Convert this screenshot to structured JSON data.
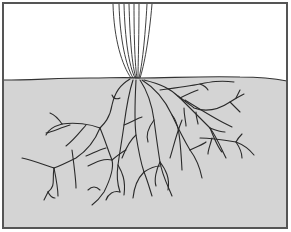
{
  "diagram": {
    "title": "",
    "colors": {
      "background": "#ffffff",
      "soil": "#d4d4d4",
      "frame": "#555555",
      "line": "#2a2a2a"
    },
    "frame": {
      "x": 3,
      "y": 3,
      "width": 284,
      "height": 225
    },
    "soil_surface": "M4,80 C30,80 60,78 90,78 C110,78 125,77 140,78 C170,78 200,76 240,77 C260,77 272,78 287,81",
    "soil_fill": "M4,80 C30,80 60,78 90,78 C110,78 125,77 140,78 C170,78 200,76 240,77 C260,77 272,78 287,81 L287,227 L4,227 Z",
    "stem_lines": [
      "M113,4 C114,40 122,65 131,78",
      "M119,4 C120,40 126,66 133,78",
      "M124,4 C125,40 129,66 135,78",
      "M129,4 C130,40 132,66 136,78",
      "M134,4 C134,40 135,66 137,78",
      "M139,4 C139,40 138,66 138,78",
      "M147,4 C145,40 142,66 139,78",
      "M152,4 C149,40 144,66 140,78"
    ],
    "roots": [
      "M130,79 C120,85 115,92 112,105 C110,118 104,124 100,128",
      "M112,95 C113,98 116,100 120,98",
      "M100,128 C90,124 75,122 62,124",
      "M62,124 C55,126 48,130 46,135",
      "M62,124 C58,118 55,115 50,113",
      "M100,128 C96,138 88,150 76,158 C68,162 60,166 54,168",
      "M54,168 C42,164 32,160 22,158",
      "M54,168 C56,178 58,190 58,196",
      "M54,168 C52,180 56,186 48,192",
      "M48,192 C50,196 52,198 55,198",
      "M48,192 C46,196 45,198 44,200",
      "M72,150 C74,165 76,180 76,188",
      "M70,125 C60,128 52,132 46,133",
      "M86,125 C80,132 74,140 66,146",
      "M100,128 C105,140 108,150 112,160 C114,168 110,180 104,192 C100,198 96,202 92,205",
      "M112,160 C104,158 96,162 88,166",
      "M112,160 C118,155 122,152 126,150",
      "M106,148 C98,150 92,154 86,156",
      "M100,190 C96,186 92,186 88,190",
      "M133,80 C128,95 126,110 124,125 C122,140 120,150 118,165 C116,178 118,186 120,192",
      "M118,165 C122,172 126,180 124,195",
      "M124,125 C132,122 138,118 142,117",
      "M120,192 C114,190 108,194 106,200",
      "M136,80 C135,100 134,118 136,135 C138,148 140,160 144,172 C148,182 150,190 152,196",
      "M136,135 C130,140 126,148 122,158",
      "M144,172 C138,178 134,188 133,198",
      "M144,172 C150,168 156,166 160,166",
      "M140,80 C148,92 152,105 154,120 C156,135 158,150 160,162 C162,175 168,186 172,196",
      "M154,120 C148,128 146,136 148,142",
      "M160,162 C166,170 170,178 168,190",
      "M160,162 C156,170 154,180 156,186",
      "M142,80 C155,88 165,100 172,115 C178,128 184,140 190,150",
      "M172,115 C178,122 180,132 182,170",
      "M182,120 C176,135 174,145 170,158",
      "M190,150 C196,158 200,168 202,178",
      "M190,150 C198,146 204,144 206,142",
      "M144,80 C160,84 170,88 180,98 C190,108 200,118 210,128 C216,136 222,150 226,158",
      "M210,128 C214,138 218,148 222,152",
      "M180,98 C186,95 192,92 198,90",
      "M160,90 C175,88 190,86 200,84 C210,82 220,80 234,82",
      "M200,84 C205,86 207,88 208,90",
      "M178,96 C186,102 192,106 194,108 C205,112 218,110 230,102 C236,98 240,96 244,94",
      "M230,102 C234,106 238,110 240,112",
      "M236,98 C238,94 239,92 240,90",
      "M185,100 C198,108 214,118 226,124 C230,126 232,127 232,127",
      "M200,138 C212,138 224,140 236,142 C244,145 250,150 254,155",
      "M236,142 C238,138 240,136 242,134",
      "M236,142 C240,148 242,154 242,158",
      "M212,138 C210,146 208,150 208,154",
      "M210,128 C215,130 220,132 225,132",
      "M184,108 C184,116 186,122 186,126",
      "M196,112 C196,118 198,122 198,124"
    ]
  }
}
